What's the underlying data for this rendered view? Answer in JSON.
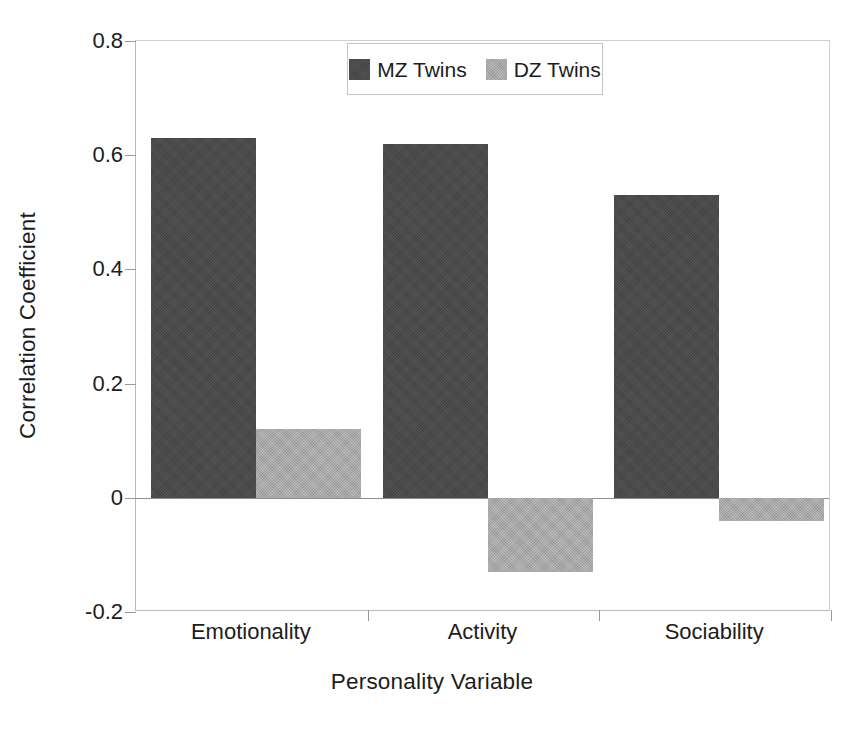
{
  "chart_data": {
    "type": "bar",
    "title": "",
    "subtitle": "",
    "xlabel": "Personality Variable",
    "ylabel": "Correlation Coefficient",
    "categories": [
      "Emotionality",
      "Activity",
      "Sociability"
    ],
    "series": [
      {
        "name": "MZ Twins",
        "color": "#4a4a4a",
        "values": [
          0.63,
          0.62,
          0.53
        ]
      },
      {
        "name": "DZ Twins",
        "color": "#a9a9a9",
        "values": [
          0.12,
          -0.13,
          -0.04
        ]
      }
    ],
    "ylim": [
      -0.2,
      0.8
    ],
    "yticks": [
      0.8,
      0.6,
      0.4,
      0.2,
      0,
      -0.2
    ],
    "ytick_labels": [
      "0.8",
      "0.6",
      "0.4",
      "0.2",
      "0",
      "-0.2"
    ],
    "grid": false,
    "legend_position": "top-center",
    "zero_line": 0,
    "bar_style": "grouped-adjacent"
  },
  "legend": {
    "entries": [
      {
        "label": "MZ Twins",
        "swatch": "dark-gray-swatch"
      },
      {
        "label": "DZ Twins",
        "swatch": "light-gray-swatch"
      }
    ]
  },
  "axes": {
    "y_title": "Correlation Coefficient",
    "x_title": "Personality Variable"
  }
}
